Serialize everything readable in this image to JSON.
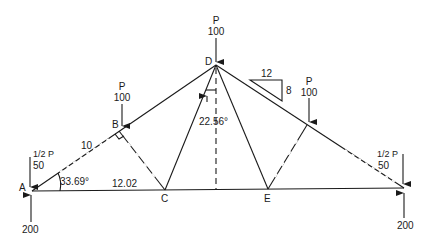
{
  "diagram": {
    "type": "roof-truss",
    "colors": {
      "line": "#1a1a1a",
      "background": "#ffffff"
    },
    "nodes": {
      "A": {
        "label": "A"
      },
      "B": {
        "label": "B"
      },
      "C": {
        "label": "C"
      },
      "D": {
        "label": "D"
      },
      "E": {
        "label": "E"
      }
    },
    "loads": {
      "apex": {
        "name": "P",
        "value": "100"
      },
      "left_panel": {
        "name": "P",
        "value": "100"
      },
      "right_panel": {
        "name": "P",
        "value": "100"
      },
      "left_end": {
        "name": "1/2 P",
        "value": "50"
      },
      "right_end": {
        "name": "1/2 P",
        "value": "50"
      }
    },
    "reactions": {
      "left": {
        "value": "200"
      },
      "right": {
        "value": "200"
      }
    },
    "dimensions": {
      "top_chord_segment": "10",
      "bottom_chord_segment": "12.02",
      "angle_at_A": "33.69°",
      "angle_at_D": "22.56°"
    },
    "slope": {
      "run": "12",
      "rise": "8"
    }
  }
}
